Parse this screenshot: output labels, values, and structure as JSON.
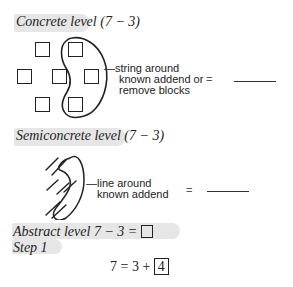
{
  "concrete": {
    "heading": "Concrete level",
    "expr": "(7 − 3)",
    "annotation_lines": [
      "—string around",
      "known addend or",
      "remove blocks"
    ],
    "equals": "=",
    "blocks_total": 7,
    "blocks_circled": 3
  },
  "semiconcrete": {
    "heading": "Semiconcrete level",
    "expr": "(7 − 3)",
    "annotation_lines": [
      "—line around",
      "known addend"
    ],
    "equals": "=",
    "tally_marks": 7,
    "tally_circled": 3
  },
  "abstract": {
    "heading": "Abstract level",
    "expr": "7 − 3 =",
    "step_label": "Step 1",
    "step_equation": "7 = 3 +",
    "step_answer": "4"
  }
}
